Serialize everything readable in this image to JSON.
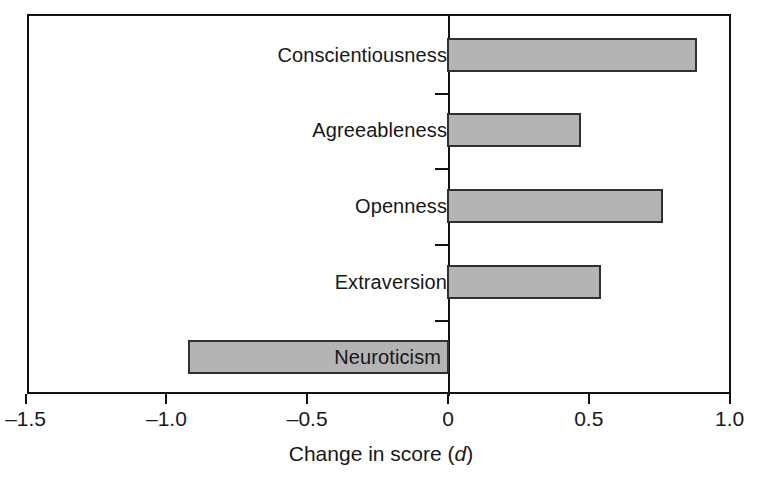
{
  "figure": {
    "axis_title_main": "Change in score (",
    "axis_title_italic": "d",
    "axis_title_close": ")",
    "axis_title_full": "Change in score (d)",
    "frame_color": "#111111",
    "bar_fill_color": "#b4b4b4",
    "bar_edge_color": "#303030",
    "text_color": "#171717",
    "background_color": "#ffffff"
  },
  "chart_data": {
    "type": "bar",
    "orientation": "horizontal",
    "title": "",
    "subtitle": "",
    "xlabel": "Change in score (d)",
    "ylabel": "",
    "categories": [
      "Conscientiousness",
      "Agreeableness",
      "Openness",
      "Extraversion",
      "Neuroticism"
    ],
    "values": [
      0.88,
      0.47,
      0.76,
      0.54,
      -0.92
    ],
    "xlim": [
      -1.5,
      1.0
    ],
    "xticks": [
      -1.5,
      -1.0,
      -0.5,
      0,
      0.5,
      1.0
    ],
    "xtick_labels": [
      "–1.5",
      "–1.0",
      "–0.5",
      "0",
      "0.5",
      "1.0"
    ],
    "grid": false,
    "legend": false,
    "legend_position": "none",
    "baseline": 0,
    "series": [
      {
        "name": "Change in score (d)",
        "values": [
          0.88,
          0.47,
          0.76,
          0.54,
          -0.92
        ]
      }
    ],
    "annotations": []
  },
  "bars": [
    {
      "label": "Conscientiousness",
      "value": 0.88,
      "label_inside": false
    },
    {
      "label": "Agreeableness",
      "value": 0.47,
      "label_inside": false
    },
    {
      "label": "Openness",
      "value": 0.76,
      "label_inside": false
    },
    {
      "label": "Extraversion",
      "value": 0.54,
      "label_inside": false
    },
    {
      "label": "Neuroticism",
      "value": -0.92,
      "label_inside": true
    }
  ],
  "xaxis": {
    "ticks": [
      {
        "value": -1.5,
        "label": "–1.5"
      },
      {
        "value": -1.0,
        "label": "–1.0"
      },
      {
        "value": -0.5,
        "label": "–0.5"
      },
      {
        "value": 0,
        "label": "0"
      },
      {
        "value": 0.5,
        "label": "0.5"
      },
      {
        "value": 1.0,
        "label": "1.0"
      }
    ]
  },
  "geometry": {
    "plot_left": 27,
    "plot_right": 731,
    "plot_top": 14,
    "plot_bottom": 394,
    "zero_x": 448,
    "px_per_unit": 281.6,
    "bar_height": 34,
    "row_centers": [
      55,
      130,
      206,
      282,
      357
    ],
    "minor_tick_y": [
      93,
      168,
      244,
      320
    ]
  }
}
